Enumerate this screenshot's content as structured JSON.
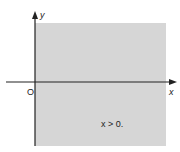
{
  "figure": {
    "region": {
      "label": "x > 0.",
      "description": "shaded right half-plane",
      "fill_color": "#d6d6d6",
      "bounds_px": {
        "left": 35,
        "top": 23,
        "right": 166,
        "bottom": 146
      }
    },
    "axes": {
      "x_label": "x",
      "y_label": "y",
      "origin_label": "O",
      "axis_color": "#222222"
    }
  }
}
